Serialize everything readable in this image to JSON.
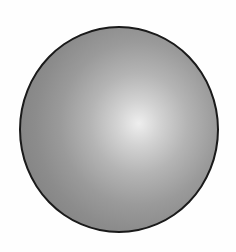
{
  "figure": {
    "shape": "sphere",
    "colors": {
      "highlight": "#eeeeee",
      "midtone": "#b4b4b4",
      "shadow": "#858585",
      "outline": "#1a1a1a",
      "background": "#ffffff"
    }
  }
}
